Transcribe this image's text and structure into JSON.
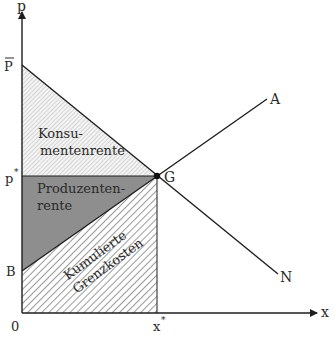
{
  "diagram": {
    "type": "supply-demand welfare diagram",
    "axes": {
      "y_label": "p",
      "x_label": "x",
      "origin_label": "0"
    },
    "ticks": {
      "p_bar": "P",
      "p_star": "p",
      "p_star_sup": "*",
      "b": "B",
      "x_star": "x",
      "x_star_sup": "*"
    },
    "curves": {
      "supply_label": "A",
      "demand_label": "N"
    },
    "equilibrium": {
      "label": "G"
    },
    "regions": {
      "consumer_surplus": {
        "line1": "Konsu-",
        "line2": "mentenrente"
      },
      "producer_surplus": {
        "line1": "Produzenten-",
        "line2": "rente"
      },
      "cumulative_costs": {
        "line1": "Kumulierte",
        "line2": "Grenzkosten"
      }
    },
    "colors": {
      "line": "#1e1e1e",
      "producer_fill": "#8e8e8e",
      "hatch_light": "#b5b5b5",
      "hatch_dark": "#9a9a9a"
    }
  }
}
